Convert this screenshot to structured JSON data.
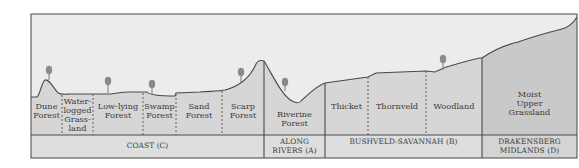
{
  "diagram": {
    "type": "landscape cross-section",
    "colors": {
      "sky": "#ececec",
      "land": "#d6d6d6",
      "land_drakensberg": "#c9c9c9",
      "region_band": "#dedede",
      "outline": "#4a4a4a",
      "tree": "#8a8a8a",
      "text": "#3a3a3a"
    },
    "habitats": [
      {
        "id": "dune-forest",
        "label": "Dune\nForest",
        "region": "C"
      },
      {
        "id": "waterlogged-grassland",
        "label": "Water-\nlogged\nGrass-\nland",
        "region": "C"
      },
      {
        "id": "low-lying-forest",
        "label": "Low-lying\nForest",
        "region": "C"
      },
      {
        "id": "swamp-forest",
        "label": "Swamp\nForest",
        "region": "C"
      },
      {
        "id": "sand-forest",
        "label": "Sand\nForest",
        "region": "C"
      },
      {
        "id": "scarp-forest",
        "label": "Scarp\nForest",
        "region": "C"
      },
      {
        "id": "riverine-forest",
        "label": "Riverine\nForest",
        "region": "A"
      },
      {
        "id": "thicket",
        "label": "Thicket",
        "region": "B"
      },
      {
        "id": "thornveld",
        "label": "Thornveld",
        "region": "B"
      },
      {
        "id": "woodland",
        "label": "Woodland",
        "region": "B"
      },
      {
        "id": "moist-upper-grassland",
        "label": "Moist\nUpper\nGrassland",
        "region": "D"
      }
    ],
    "regions": [
      {
        "id": "coast",
        "label": "COAST (C)"
      },
      {
        "id": "along-rivers",
        "label": "ALONG\nRIVERS (A)"
      },
      {
        "id": "bushveld-savannah",
        "label": "BUSHVELD-SAVANNAH (B)"
      },
      {
        "id": "drakensberg-midlands",
        "label": "DRAKENSBERG\nMIDLANDS (D)"
      }
    ],
    "trees": [
      {
        "near": "dune-forest"
      },
      {
        "near": "low-lying-forest"
      },
      {
        "near": "swamp-forest"
      },
      {
        "near": "scarp-forest"
      },
      {
        "near": "riverine-forest"
      },
      {
        "near": "woodland"
      }
    ]
  }
}
